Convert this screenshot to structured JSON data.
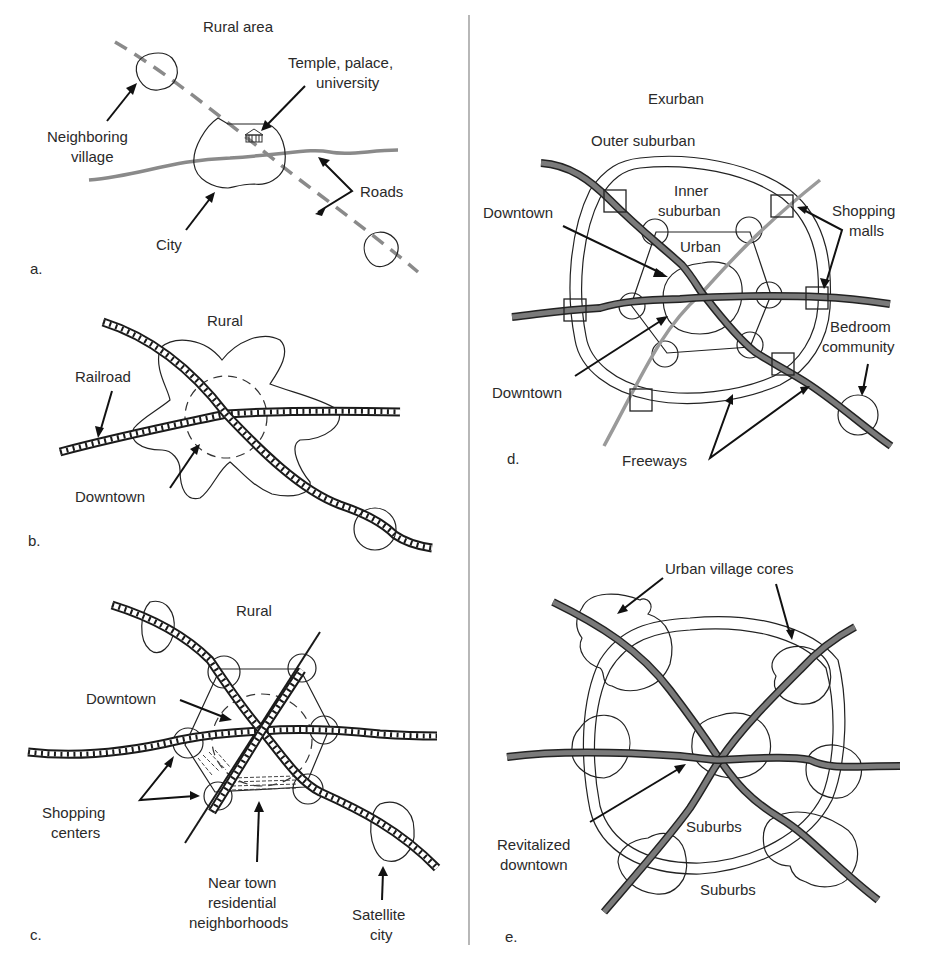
{
  "figure": {
    "panels": [
      {
        "id": "a",
        "panel_label": "a.",
        "title": "Rural area",
        "labels": {
          "neighboring_village": [
            "Neighboring",
            "village"
          ],
          "temple": [
            "Temple, palace,",
            "university"
          ],
          "roads": "Roads",
          "city": "City"
        },
        "icons": [
          "temple-icon"
        ]
      },
      {
        "id": "b",
        "panel_label": "b.",
        "title": "Rural",
        "labels": {
          "railroad": "Railroad",
          "downtown": "Downtown"
        }
      },
      {
        "id": "c",
        "panel_label": "c.",
        "title": "Rural",
        "labels": {
          "downtown": "Downtown",
          "shopping_centers": [
            "Shopping",
            "centers"
          ],
          "near_town": [
            "Near town",
            "residential",
            "neighborhoods"
          ],
          "satellite_city": [
            "Satellite",
            "city"
          ]
        }
      },
      {
        "id": "d",
        "panel_label": "d.",
        "title": "Exurban",
        "labels": {
          "outer_suburban": "Outer suburban",
          "inner_suburban": [
            "Inner",
            "suburban"
          ],
          "urban": "Urban",
          "downtown_top": "Downtown",
          "downtown_bottom": "Downtown",
          "shopping_malls": [
            "Shopping",
            "malls"
          ],
          "bedroom_community": [
            "Bedroom",
            "community"
          ],
          "freeways": "Freeways"
        }
      },
      {
        "id": "e",
        "panel_label": "e.",
        "labels": {
          "urban_village_cores": "Urban village cores",
          "revitalized_downtown": [
            "Revitalized",
            "downtown"
          ],
          "suburbs_inner": "Suburbs",
          "suburbs_outer": "Suburbs"
        }
      }
    ],
    "colors": {
      "ink": "#222222",
      "road_gray": "#8a8a8a",
      "freeway_fill": "#7a7a7a",
      "background": "#ffffff"
    }
  }
}
